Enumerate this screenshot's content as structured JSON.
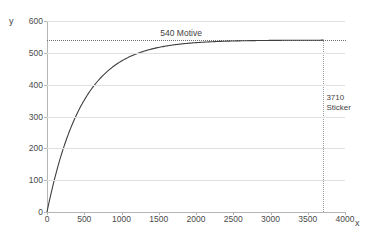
{
  "chart_data": {
    "type": "line",
    "title": "",
    "xlabel": "x",
    "ylabel": "y",
    "xlim": [
      0,
      4000
    ],
    "ylim": [
      0,
      600
    ],
    "grid": true,
    "legend": "none",
    "x_ticks": [
      "0",
      "500",
      "1000",
      "1500",
      "2000",
      "2500",
      "3000",
      "3500",
      "4000"
    ],
    "x_tick_values": [
      0,
      500,
      1000,
      1500,
      2000,
      2500,
      3000,
      3500,
      4000
    ],
    "y_ticks": [
      "0",
      "100",
      "200",
      "300",
      "400",
      "500",
      "600"
    ],
    "y_tick_values": [
      0,
      100,
      200,
      300,
      400,
      500,
      600
    ],
    "series": [
      {
        "name": "saturation-curve",
        "color": "#3f3f3f",
        "model": "y = 540 * (1 - exp(-x / 475))",
        "x": [
          0,
          100,
          200,
          300,
          400,
          500,
          600,
          700,
          800,
          900,
          1000,
          1200,
          1400,
          1600,
          1800,
          2000,
          2200,
          2400,
          2600,
          2800,
          3000,
          3200,
          3400,
          3600,
          3710
        ],
        "y": [
          0,
          103,
          187,
          256,
          312,
          359,
          398,
          430,
          456,
          478,
          496,
          524,
          539,
          540,
          540,
          540,
          540,
          540,
          540,
          540,
          540,
          540,
          540,
          540,
          540
        ]
      }
    ],
    "annotations": [
      {
        "name": "asymptote",
        "value": 540,
        "label": "540 Motive",
        "style": "horizontal-dotted",
        "label_x": 1800
      },
      {
        "name": "x-marker",
        "value": 3710,
        "label_line1": "3710",
        "label_line2": "Sticker",
        "style": "vertical-dotted"
      }
    ]
  },
  "axes": {
    "y_letter": "y",
    "x_letter": "x"
  },
  "colors": {
    "curve": "#3f3f3f",
    "grid": "#e0e0e0",
    "axis": "#b5b5b5",
    "dotted_dark": "#6e6e6e",
    "dotted_light": "#9a9a9a",
    "text": "#3f3f3f",
    "background": "#ffffff"
  }
}
